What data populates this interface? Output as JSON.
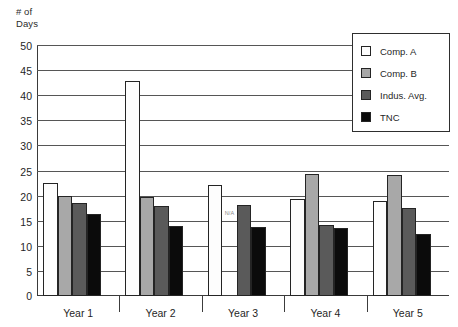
{
  "chart_data": {
    "type": "bar",
    "title": "",
    "subtitle": "",
    "xlabel": "",
    "ylabel": "# of\nDays",
    "ylim": [
      0,
      50
    ],
    "ytick_step": 5,
    "ytick_labels": [
      "0",
      "5",
      "10",
      "15",
      "20",
      "25",
      "30",
      "35",
      "40",
      "45",
      "50"
    ],
    "grid": true,
    "legend_position": "top-right",
    "categories": [
      "Year 1",
      "Year 2",
      "Year 3",
      "Year 4",
      "Year 5"
    ],
    "series": [
      {
        "name": "Comp. A",
        "color": "#fdfdfd",
        "values": [
          22.5,
          42.8,
          22.1,
          19.4,
          19.0
        ]
      },
      {
        "name": "Comp. B",
        "color": "#a8a8a8",
        "values": [
          19.9,
          19.7,
          null,
          24.4,
          24.2
        ]
      },
      {
        "name": "Indus. Avg.",
        "color": "#5a5a5a",
        "values": [
          18.5,
          17.9,
          18.1,
          14.2,
          17.6
        ]
      },
      {
        "name": "TNC",
        "color": "#0b0b0b",
        "values": [
          16.4,
          14.0,
          13.7,
          13.5,
          12.3
        ]
      }
    ],
    "annotations": [
      {
        "text": "N/A",
        "category": "Year 3",
        "series": "Comp. B"
      }
    ]
  },
  "legend": {
    "items": [
      {
        "label": "Comp. A"
      },
      {
        "label": "Comp. B"
      },
      {
        "label": "Indus. Avg."
      },
      {
        "label": "TNC"
      }
    ]
  },
  "axis": {
    "y_title": "# of\nDays"
  }
}
